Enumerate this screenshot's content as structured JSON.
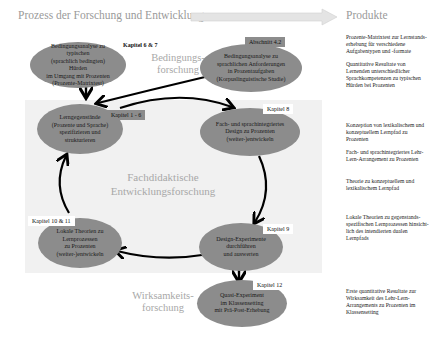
{
  "header": {
    "process_title": "Prozess der Forschung und Entwicklung",
    "products_title": "Produkte"
  },
  "phases": {
    "bedingungsforschung": "Bedingungs-\nforschung",
    "bedingungsforschung_l1": "Bedingungs-",
    "bedingungsforschung_l2": "forschung",
    "center_l1": "Fachdidaktische",
    "center_l2": "Entwicklungsforschung",
    "wirksamkeit_l1": "Wirksamkeits-",
    "wirksamkeit_l2": "forschung"
  },
  "nodes": [
    {
      "id": "bedingungsanalyse-huerden",
      "chapter": "Kapitel 6 & 7",
      "lines": [
        "Bedingungsanalyse zu typischen",
        "(sprachlich bedingten) Hürden",
        "im Umgang mit Prozenten",
        "(Prozente-Matrixtest)"
      ]
    },
    {
      "id": "bedingungsanalyse-anforderungen",
      "chapter": "Abschnitt 4.2",
      "lines": [
        "Bedingungsanalyse zu",
        "sprachlichen Anforderungen",
        "in Prozentaufgaben",
        "(Korpuslinguistische Studie)"
      ]
    },
    {
      "id": "lerngegenstaende",
      "chapter": "Kapitel 1 - 6",
      "lines": [
        "Lerngegenstände",
        "(Prozente und Sprache)",
        "spezifizieren und",
        "strukturieren"
      ]
    },
    {
      "id": "design",
      "chapter": "Kapitel 8",
      "lines": [
        "Fach- und sprachintegriertes",
        "Design zu Prozenten",
        "(weiter-)entwickeln"
      ]
    },
    {
      "id": "lokale-theorien",
      "chapter": "Kapitel 10 & 11",
      "lines": [
        "Lokale Theorien zu",
        "Lernprozessen",
        "zu Prozenten",
        "(weiter-)entwickeln"
      ]
    },
    {
      "id": "design-experimente",
      "chapter": "Kapitel 9",
      "lines": [
        "Design-Experimente",
        "durchführen",
        "und auswerten"
      ]
    },
    {
      "id": "quasi-experiment",
      "chapter": "Kapitel 12",
      "lines": [
        "Quasi-Experiment",
        "im Klassensetting",
        "mit Prä-Post-Erhebung"
      ]
    }
  ],
  "products": [
    {
      "lines": [
        "Prozente-Matrixtest zur Lernstands-",
        "erhebung für verschiedene",
        "Aufgabentypen und -formate"
      ]
    },
    {
      "lines": [
        "Quantitative Resultate von",
        "Lernenden unterschiedlicher",
        "Sprachkompetenzen zu typischen",
        "Hürden bei Prozenten"
      ]
    },
    {
      "lines": [
        "Konzeption von lexikalischem und",
        "konzeptuellem Lernpfad zu",
        "Prozenten"
      ]
    },
    {
      "lines": [
        "Fach- und sprachintegriertes Lehr-",
        "Lern-Arrangement zu Prozenten"
      ]
    },
    {
      "lines": [
        "Theorie zu konzeptuellem und",
        "lexikalischem Lernpfad"
      ]
    },
    {
      "lines": [
        "Lokale Theorien zu gegenstands-",
        "spezifischen Lernprozessen hinsicht-",
        "lich des intendierten dualen",
        "Lernpfads"
      ]
    },
    {
      "lines": [
        "Erste quantitative Resultate zur",
        "Wirksamkeit des Lehr-Lern-",
        "Arrangements zu Prozenten im",
        "Klassensetting"
      ]
    }
  ],
  "colors": {
    "ellipse": "#8c8c8c",
    "panel": "#f1f1f1",
    "phase_text": "#a8a8a8",
    "arrow": "#000000",
    "top_arrow": "#e2e2e2"
  }
}
